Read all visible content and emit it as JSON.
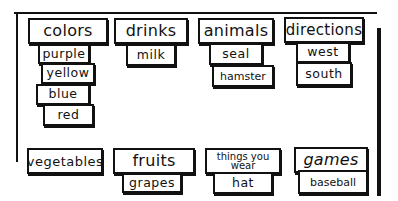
{
  "board": {
    "columns_top": [
      {
        "header": "colors",
        "items": [
          "purple",
          "yellow",
          "blue",
          "red"
        ]
      },
      {
        "header": "drinks",
        "items": [
          "milk"
        ]
      },
      {
        "header": "animals",
        "items": [
          "seal",
          "hamster"
        ]
      },
      {
        "header": "directions",
        "items": [
          "west",
          "south"
        ]
      }
    ],
    "columns_bottom": [
      {
        "header": "vegetables",
        "items": []
      },
      {
        "header": "fruits",
        "items": [
          "grapes"
        ]
      },
      {
        "header_line1": "things you",
        "header_line2": "wear",
        "items": [
          "hat"
        ]
      },
      {
        "header": "games",
        "items": [
          "baseball"
        ]
      }
    ]
  }
}
